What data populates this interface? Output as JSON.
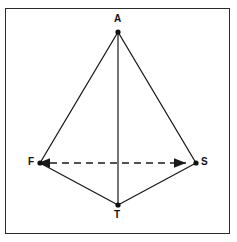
{
  "figure": {
    "background_color": "#ffffff",
    "border_color": "#2b2b2b",
    "stroke_color": "#1a1a1a",
    "frame": {
      "x": 5,
      "y": 8,
      "width": 225,
      "height": 226
    },
    "vertices": [
      {
        "id": "A",
        "label": "A",
        "x": 118,
        "y": 32,
        "marker": "filled-dot",
        "label_x": 114,
        "label_y": 14
      },
      {
        "id": "F",
        "label": "F",
        "x": 40,
        "y": 163,
        "marker": "filled-dot",
        "label_x": 28,
        "label_y": 157
      },
      {
        "id": "S",
        "label": "S",
        "x": 196,
        "y": 163,
        "marker": "filled-dot",
        "label_x": 201,
        "label_y": 157
      },
      {
        "id": "T",
        "label": "T",
        "x": 118,
        "y": 205,
        "marker": "filled-dot",
        "label_x": 114,
        "label_y": 210
      }
    ],
    "edges": [
      {
        "id": "A-F",
        "from": "A",
        "to": "F",
        "style": "solid",
        "arrows": "none"
      },
      {
        "id": "A-S",
        "from": "A",
        "to": "S",
        "style": "solid",
        "arrows": "none"
      },
      {
        "id": "A-T",
        "from": "A",
        "to": "T",
        "style": "solid",
        "arrows": "none"
      },
      {
        "id": "F-T",
        "from": "F",
        "to": "T",
        "style": "solid",
        "arrows": "none"
      },
      {
        "id": "T-S",
        "from": "T",
        "to": "S",
        "style": "solid",
        "arrows": "none"
      },
      {
        "id": "F-S",
        "from": "F",
        "to": "S",
        "style": "dashed",
        "arrows": "both",
        "dash_pattern": "7 5"
      }
    ],
    "labels": {
      "apex": "A",
      "left": "F",
      "right": "S",
      "bottom": "T"
    }
  }
}
